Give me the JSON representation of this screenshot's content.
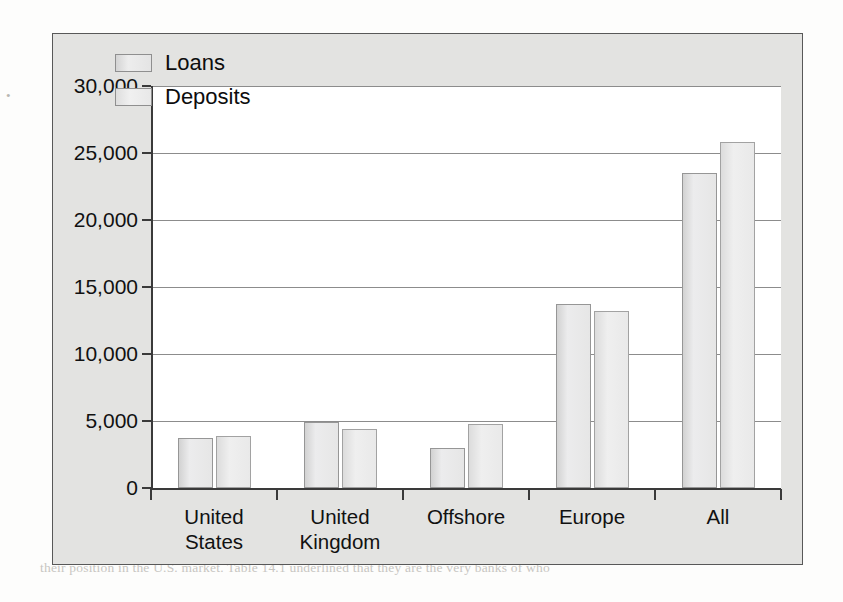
{
  "scan": {
    "bleed_text": [
      "Conclusion is reflected in the role of the Japanese banks in various segments",
      "of the markets area measures. While the Japanese banks have a large share",
      "of the total on-balance sheet volume, for example, their share of the notional",
      "value of the OTC derivatives exceeded 2 percent.",
      "A number of possible explanations for the apparently poor showing",
      "of the subsidiaries of the U.S. financial system far behind the principal by",
      "the U.S. authorities had identified. These are more institutions that are",
      "actively encouraged in the Euro markets. The second layer of the relative in",
      "the market, they are reflected in Table 14.1 and the United States institutions",
      "over the United States in a comparison.",
      "THE COMPETITIVENESS OF JAPANESE INSTITUTIONS",
      "To summarize the argument thus far, the Japanese banks are not as dominant",
      "international lenders as is sometimes believed. They have a large profile in",
      "certain national markets and are major players in these markets, in large part the",
      "most significant markets, but they are not obviously dominant.",
      "their position in the U.S. market. Table 14.1 underlined that they are the very banks of who"
    ],
    "left_margin_mark": "•"
  },
  "chart_data": {
    "type": "bar",
    "title": "",
    "xlabel": "",
    "ylabel": "",
    "categories": [
      "United\nStates",
      "United\nKingdom",
      "Offshore",
      "Europe",
      "All"
    ],
    "series": [
      {
        "name": "Loans",
        "values": [
          3700,
          4900,
          3000,
          13700,
          23500
        ]
      },
      {
        "name": "Deposits",
        "values": [
          3900,
          4400,
          4800,
          13200,
          25800
        ]
      }
    ],
    "ylim": [
      0,
      30000
    ],
    "ytick_values": [
      0,
      5000,
      10000,
      15000,
      20000,
      25000,
      30000
    ],
    "ytick_labels": [
      "0",
      "5,000",
      "10,000",
      "15,000",
      "20,000",
      "25,000",
      "30,000"
    ],
    "grid": true,
    "legend_position": "top-left-inside",
    "colors": {
      "loans_fill": "#ebebeb",
      "loans_border": "#969696",
      "deposits_fill": "#efefef",
      "deposits_border": "#a2a2a2",
      "plot_background": "#ffffff",
      "frame_background": "#e3e3e1",
      "axis": "#3a3a3a",
      "gridline": "#8c8c8c"
    }
  }
}
